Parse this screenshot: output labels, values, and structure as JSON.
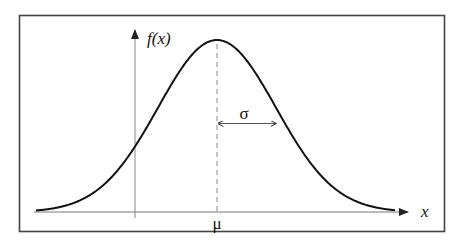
{
  "diagram": {
    "y_axis_label": "f(x)",
    "x_axis_label": "x",
    "mean_label": "μ",
    "stddev_label": "σ",
    "colors": {
      "curve": "#111111",
      "axes": "#666666",
      "frame": "#444444",
      "dashed_mean_line": "#888888",
      "background": "#ffffff"
    }
  },
  "chart_data": {
    "type": "line",
    "xlabel": "x",
    "ylabel": "f(x)",
    "annotations": [
      "μ (mean, at peak)",
      "σ (standard deviation, from μ to inflection point)"
    ],
    "grid": false,
    "legend": null
  }
}
